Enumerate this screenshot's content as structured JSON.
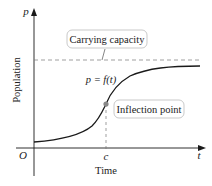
{
  "diagram": {
    "type": "logistic-growth-curve",
    "y_axis": {
      "symbol": "p",
      "label": "Population"
    },
    "x_axis": {
      "symbol": "t",
      "label": "Time",
      "origin": "O",
      "tick": "c"
    },
    "curve_label": "p = f(t)",
    "callouts": {
      "carrying_capacity": "Carrying capacity",
      "inflection_point": "Inflection point"
    },
    "colors": {
      "curve": "#1a1a1a",
      "axes": "#1a1a1a",
      "dashed": "#777777",
      "callout_border": "#bbbbbb",
      "inflection_dot": "#888888"
    }
  }
}
